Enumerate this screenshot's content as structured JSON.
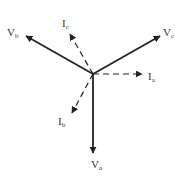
{
  "diagram": {
    "title": "",
    "origin": [
      93,
      74
    ],
    "colors": {
      "stroke": "#222222",
      "text": "#333333",
      "background": "#ffffff"
    },
    "phasors": [
      {
        "id": "Va",
        "main": "V",
        "sub": "a",
        "kind": "voltage",
        "style": "solid",
        "tip": [
          93,
          153
        ],
        "label_pos": [
          91,
          165
        ]
      },
      {
        "id": "Vb",
        "main": "V",
        "sub": "b",
        "kind": "voltage",
        "style": "solid",
        "tip": [
          26,
          36
        ],
        "label_pos": [
          8,
          33
        ]
      },
      {
        "id": "Vc",
        "main": "V",
        "sub": "c",
        "kind": "voltage",
        "style": "solid",
        "tip": [
          160,
          36
        ],
        "label_pos": [
          163,
          33
        ]
      },
      {
        "id": "Ia",
        "main": "I",
        "sub": "a",
        "kind": "current",
        "style": "dashed",
        "tip": [
          142,
          74
        ],
        "label_pos": [
          149,
          80
        ]
      },
      {
        "id": "Ib",
        "main": "I",
        "sub": "b",
        "kind": "current",
        "style": "dashed",
        "tip": [
          72,
          113
        ],
        "label_pos": [
          58,
          125
        ]
      },
      {
        "id": "Ic",
        "main": "I",
        "sub": "c",
        "kind": "current",
        "style": "dashed",
        "tip": [
          70,
          34
        ],
        "label_pos": [
          62,
          26
        ]
      }
    ]
  }
}
